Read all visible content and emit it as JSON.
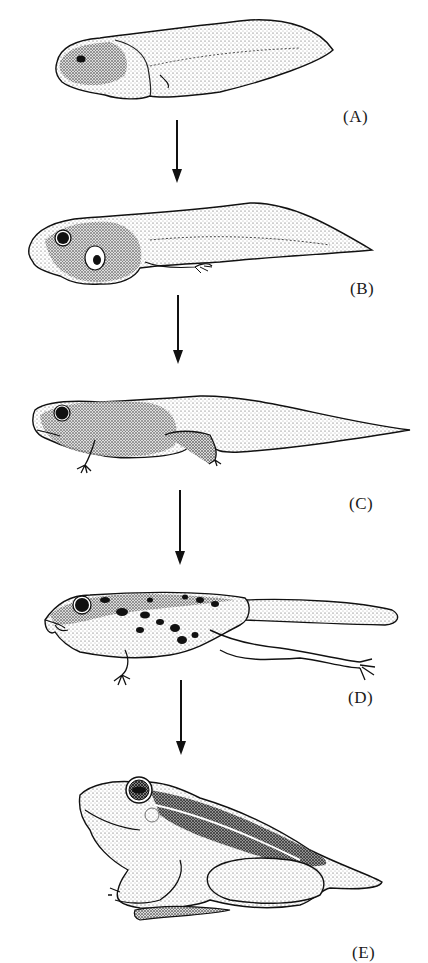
{
  "figure": {
    "stages": [
      {
        "id": "A",
        "label": "(A)",
        "description": "early tadpole"
      },
      {
        "id": "B",
        "label": "(B)",
        "description": "tadpole with hind limb buds"
      },
      {
        "id": "C",
        "label": "(C)",
        "description": "tadpole with hind legs and forelimbs"
      },
      {
        "id": "D",
        "label": "(D)",
        "description": "froglet with shrinking tail"
      },
      {
        "id": "E",
        "label": "(E)",
        "description": "adult frog"
      }
    ],
    "arrows": [
      {
        "from": "A",
        "to": "B"
      },
      {
        "from": "B",
        "to": "C"
      },
      {
        "from": "C",
        "to": "D"
      },
      {
        "from": "D",
        "to": "E"
      }
    ]
  },
  "colors": {
    "ink": "#111111",
    "background": "#ffffff",
    "stipple": "#555555"
  }
}
